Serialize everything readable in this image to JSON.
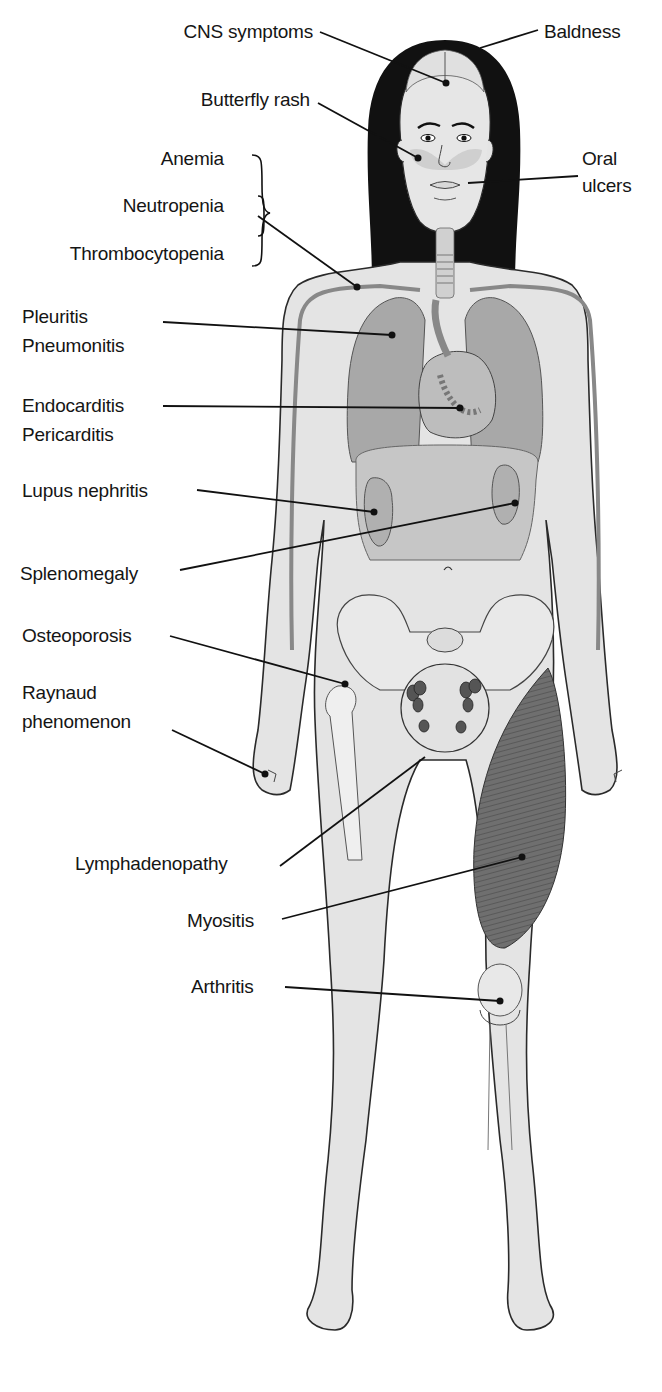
{
  "diagram": {
    "colors": {
      "skin": "#e4e4e4",
      "outline": "#2a2a2a",
      "organ": "#a9a9a9",
      "organ_dark": "#8a8a8a",
      "hair": "#111111",
      "muscle": "#6d6d6d",
      "leader": "#111111"
    },
    "labels": {
      "cns": "CNS symptoms",
      "baldness": "Baldness",
      "butterfly_rash": "Butterfly rash",
      "anemia": "Anemia",
      "oral_line1": "Oral",
      "oral_line2": "ulcers",
      "neutropenia": "Neutropenia",
      "thrombocytopenia": "Thrombocytopenia",
      "pleuritis": "Pleuritis",
      "pneumonitis": "Pneumonitis",
      "endocarditis": "Endocarditis",
      "pericarditis": "Pericarditis",
      "lupus_nephritis": "Lupus nephritis",
      "splenomegaly": "Splenomegaly",
      "osteoporosis": "Osteoporosis",
      "raynaud_line1": "Raynaud",
      "raynaud_line2": "phenomenon",
      "lymphadenopathy": "Lymphadenopathy",
      "myositis": "Myositis",
      "arthritis": "Arthritis"
    }
  }
}
